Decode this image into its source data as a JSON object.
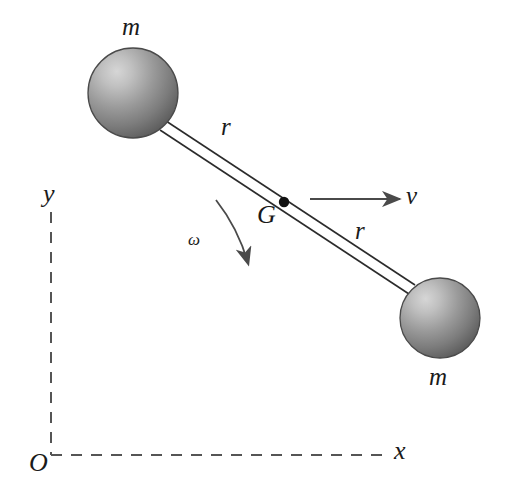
{
  "figure": {
    "background_color": "#ffffff",
    "ink_color": "#1a1a1a",
    "rod_color": "#2b2b2b",
    "axis_color": "#555555",
    "sphere_fill_light": "#cccccc",
    "sphere_fill_dark": "#6e6e6e",
    "sphere_edge": "#4a4a4a"
  },
  "labels": {
    "mass_top": "m",
    "mass_bottom": "m",
    "radius_upper": "r",
    "radius_lower": "r",
    "centre_of_mass": "G",
    "velocity": "v",
    "angular_velocity": "ω",
    "axis_x": "x",
    "axis_y": "y",
    "origin": "O"
  },
  "geometry": {
    "sphere_top": {
      "cx": 133,
      "cy": 93,
      "r": 45
    },
    "sphere_bottom": {
      "cx": 440,
      "cy": 318,
      "r": 40
    },
    "centre_dot": {
      "cx": 284,
      "cy": 202,
      "r": 5
    },
    "rod_start": {
      "x": 163,
      "y": 126
    },
    "rod_end": {
      "x": 412,
      "y": 290
    },
    "velocity_arrow": {
      "x1": 310,
      "y1": 199,
      "x2": 400,
      "y2": 199
    },
    "omega_arc": {
      "x1": 216,
      "y1": 200,
      "cx": 240,
      "cy": 232,
      "x2": 250,
      "y2": 268
    },
    "axis_y_line": {
      "x": 51,
      "y1": 212,
      "y2": 455
    },
    "axis_x_line": {
      "y": 455,
      "x1": 51,
      "x2": 388
    },
    "dash_pattern": "11 9"
  },
  "label_positions": {
    "mass_top": {
      "left": 122,
      "top": 14
    },
    "mass_bottom": {
      "left": 429,
      "top": 364
    },
    "radius_upper": {
      "left": 221,
      "top": 114
    },
    "radius_lower": {
      "left": 355,
      "top": 218
    },
    "centre_of_mass": {
      "left": 257,
      "top": 202
    },
    "velocity": {
      "left": 406,
      "top": 183
    },
    "angular_velocity": {
      "left": 188,
      "top": 231
    },
    "axis_x": {
      "left": 394,
      "top": 438
    },
    "axis_y": {
      "left": 43,
      "top": 181
    },
    "origin": {
      "left": 29,
      "top": 450
    }
  }
}
